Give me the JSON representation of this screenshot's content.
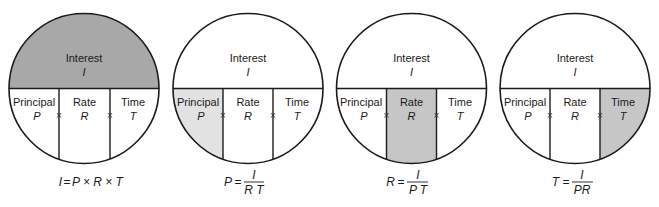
{
  "colors": {
    "outline": "#1a1a1a",
    "interest_highlight": "#a8a8a8",
    "principal_highlight": "#e2e2e2",
    "rate_highlight": "#c6c6c6",
    "time_highlight": "#c6c6c6",
    "background": "#ffffff"
  },
  "labels": {
    "interest": "Interest",
    "interest_var": "I",
    "principal": "Principal",
    "principal_var": "P",
    "rate": "Rate",
    "rate_var": "R",
    "time": "Time",
    "time_var": "T",
    "times_sign": "×"
  },
  "diagrams": [
    {
      "highlighted": "interest",
      "formula": {
        "lhs": "I",
        "eq": "=",
        "rhs": "P × R × T"
      }
    },
    {
      "highlighted": "principal",
      "formula": {
        "lhs": "P",
        "eq": "=",
        "numerator": "I",
        "denominator": "R T"
      }
    },
    {
      "highlighted": "rate",
      "formula": {
        "lhs": "R",
        "eq": "=",
        "numerator": "I",
        "denominator": "P T"
      }
    },
    {
      "highlighted": "time",
      "formula": {
        "lhs": "T",
        "eq": "=",
        "numerator": "I",
        "denominator": "PR"
      }
    }
  ]
}
